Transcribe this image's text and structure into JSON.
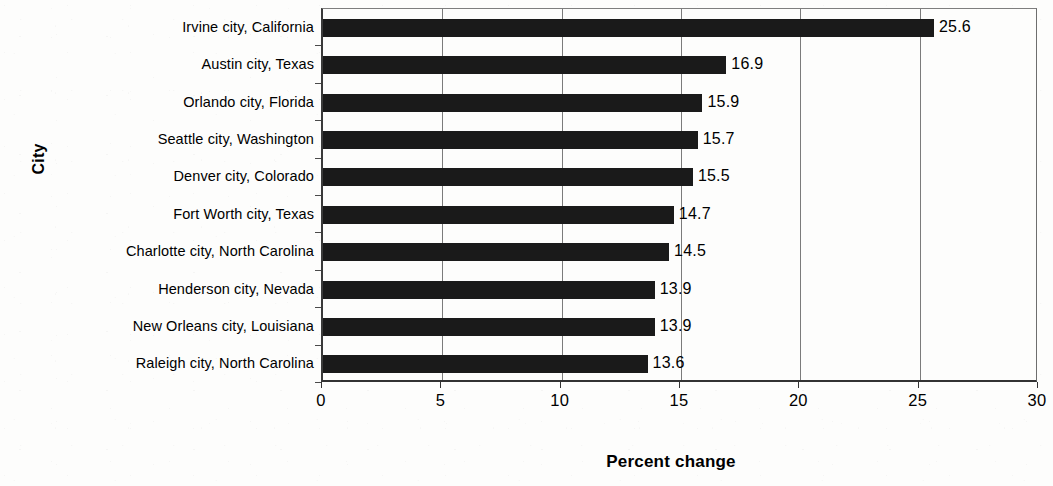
{
  "chart_data": {
    "type": "bar",
    "orientation": "horizontal",
    "title": "",
    "xlabel": "Percent change",
    "ylabel": "City",
    "categories": [
      "Irvine city, California",
      "Austin city, Texas",
      "Orlando city, Florida",
      "Seattle city, Washington",
      "Denver city, Colorado",
      "Fort Worth city, Texas",
      "Charlotte city, North Carolina",
      "Henderson city, Nevada",
      "New Orleans city, Louisiana",
      "Raleigh city, North Carolina"
    ],
    "values": [
      25.6,
      16.9,
      15.9,
      15.7,
      15.5,
      14.7,
      14.5,
      13.9,
      13.9,
      13.6
    ],
    "value_labels": [
      "25.6",
      "16.9",
      "15.9",
      "15.7",
      "15.5",
      "14.7",
      "14.5",
      "13.9",
      "13.9",
      "13.6"
    ],
    "xlim": [
      0,
      30
    ],
    "xticks": [
      0,
      5,
      10,
      15,
      20,
      25,
      30
    ],
    "xtick_labels": [
      "0",
      "5",
      "10",
      "15",
      "20",
      "25",
      "30"
    ],
    "grid": "vertical",
    "legend": "none",
    "bar_color": "#1a1a1a",
    "background_color": "#fdfdfc",
    "axis_color": "#333333",
    "gridline_color": "#7b7b7b"
  }
}
